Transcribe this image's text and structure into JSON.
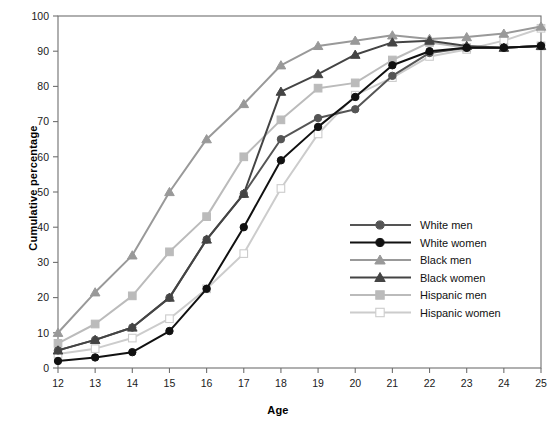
{
  "chart_data": {
    "type": "line",
    "title": "",
    "xlabel": "Age",
    "ylabel": "Cumulative percentage",
    "xlim": [
      12,
      25
    ],
    "ylim": [
      0,
      100
    ],
    "grid": false,
    "legend_position": "inside-right",
    "x": [
      12,
      13,
      14,
      15,
      16,
      17,
      18,
      19,
      20,
      21,
      22,
      23,
      24,
      25
    ],
    "xticks": [
      "12",
      "13",
      "14",
      "15",
      "16",
      "17",
      "18",
      "19",
      "20",
      "21",
      "22",
      "23",
      "24",
      "25"
    ],
    "yticks": [
      "0",
      "10",
      "20",
      "30",
      "40",
      "50",
      "60",
      "70",
      "80",
      "90",
      "100"
    ],
    "series": [
      {
        "name": "White men",
        "color": "#555555",
        "marker": "circle",
        "fill": "#555555",
        "values": [
          5,
          8,
          11.5,
          20,
          36.5,
          49.5,
          65,
          71,
          73.5,
          83,
          89.5,
          91,
          91,
          91.5
        ]
      },
      {
        "name": "White women",
        "color": "#111111",
        "marker": "circle",
        "fill": "#111111",
        "values": [
          2,
          3,
          4.5,
          10.5,
          22.5,
          40,
          59,
          68.5,
          77,
          86,
          90,
          91,
          91,
          91.5
        ]
      },
      {
        "name": "Black men",
        "color": "#999999",
        "marker": "triangle",
        "fill": "#999999",
        "values": [
          10,
          21.5,
          32,
          50,
          65,
          75,
          86,
          91.5,
          93,
          94.5,
          93.5,
          94,
          95,
          97
        ]
      },
      {
        "name": "Black women",
        "color": "#444444",
        "marker": "triangle",
        "fill": "#444444",
        "values": [
          5,
          8,
          11.5,
          20,
          36.5,
          49.5,
          78.5,
          83.5,
          89,
          92.5,
          93,
          91.5,
          91,
          91.5
        ]
      },
      {
        "name": "Hispanic men",
        "color": "#bbbbbb",
        "marker": "square",
        "fill": "#bbbbbb",
        "values": [
          7,
          12.5,
          20.5,
          33,
          43,
          60,
          70.5,
          79.5,
          81,
          87.5,
          92.5,
          91,
          91,
          91.5
        ]
      },
      {
        "name": "Hispanic women",
        "color": "#cccccc",
        "marker": "square",
        "fill": "#ffffff",
        "values": [
          4,
          5.5,
          8.5,
          14,
          22.5,
          32.5,
          51,
          66.5,
          77.5,
          82.5,
          88.5,
          90.5,
          93,
          96.5
        ]
      }
    ]
  },
  "legend": {
    "items": [
      {
        "label": "White men"
      },
      {
        "label": "White women"
      },
      {
        "label": "Black men"
      },
      {
        "label": "Black women"
      },
      {
        "label": "Hispanic men"
      },
      {
        "label": "Hispanic women"
      }
    ]
  }
}
